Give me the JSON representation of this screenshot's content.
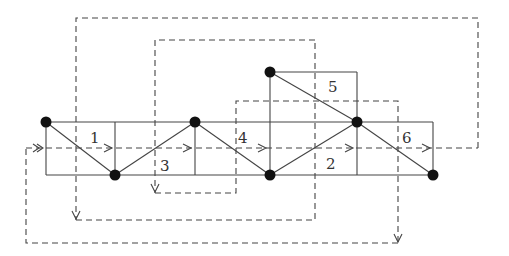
{
  "diagram": {
    "cell_labels": [
      {
        "id": "1",
        "text": "1",
        "x": 90,
        "y": 143
      },
      {
        "id": "2",
        "text": "2",
        "x": 326,
        "y": 169
      },
      {
        "id": "3",
        "text": "3",
        "x": 160,
        "y": 171
      },
      {
        "id": "4",
        "text": "4",
        "x": 238,
        "y": 143
      },
      {
        "id": "5",
        "text": "5",
        "x": 328,
        "y": 92
      },
      {
        "id": "6",
        "text": "6",
        "x": 402,
        "y": 143
      }
    ],
    "nodes": [
      {
        "x": 46,
        "y": 122
      },
      {
        "x": 115,
        "y": 175
      },
      {
        "x": 195,
        "y": 122
      },
      {
        "x": 270,
        "y": 175
      },
      {
        "x": 270,
        "y": 72
      },
      {
        "x": 357,
        "y": 122
      },
      {
        "x": 433,
        "y": 175
      }
    ],
    "colors": {
      "line": "#444444",
      "node": "#111111",
      "background": "#ffffff"
    }
  }
}
